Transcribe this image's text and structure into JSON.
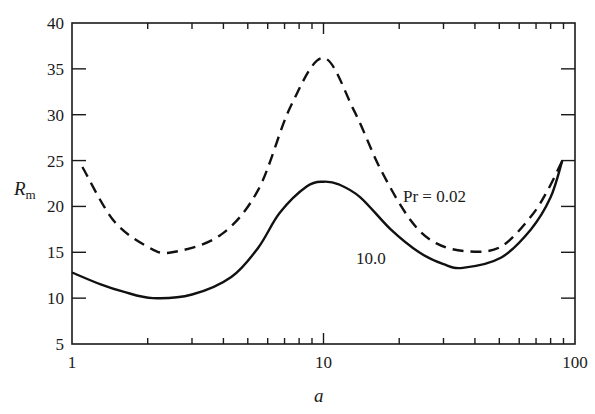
{
  "chart_data": {
    "type": "line",
    "title": "",
    "xlabel": "a",
    "ylabel": "R",
    "ylabel_subscript": "m",
    "xscale": "log",
    "xlim": [
      1,
      100
    ],
    "ylim": [
      5,
      40
    ],
    "x_ticks": [
      1,
      10,
      100
    ],
    "x_tick_labels": [
      "1",
      "10",
      "100"
    ],
    "y_ticks": [
      5,
      10,
      15,
      20,
      25,
      30,
      35,
      40
    ],
    "y_tick_labels": [
      "5",
      "10",
      "15",
      "20",
      "25",
      "30",
      "35",
      "40"
    ],
    "grid": false,
    "legend": "inline annotations",
    "series": [
      {
        "name": "Pr = 0.02",
        "style": "dashed",
        "annotation": "Pr = 0.02",
        "x": [
          1.1,
          1.46,
          2.0,
          2.5,
          3.9,
          5.5,
          7.4,
          10.0,
          13.2,
          16.9,
          22.2,
          28.0,
          37.5,
          50.7,
          66.8,
          78.0,
          89.0
        ],
        "y": [
          24.3,
          18.5,
          15.6,
          15.0,
          16.9,
          21.8,
          30.9,
          36.2,
          30.5,
          24.0,
          18.5,
          16.0,
          15.1,
          15.6,
          18.9,
          21.8,
          25.0
        ]
      },
      {
        "name": "Pr = 10.0",
        "style": "solid",
        "annotation": "10.0",
        "x": [
          1.0,
          1.3,
          1.6,
          2.1,
          3.0,
          4.3,
          5.5,
          6.7,
          8.6,
          10.0,
          11.5,
          14.0,
          18.5,
          24.0,
          30.0,
          35.8,
          50.7,
          66.8,
          80.0,
          89.0
        ],
        "y": [
          12.8,
          11.5,
          10.7,
          10.0,
          10.4,
          12.3,
          15.5,
          19.3,
          22.2,
          22.7,
          22.4,
          21.0,
          17.5,
          15.0,
          13.7,
          13.3,
          14.4,
          17.5,
          21.0,
          25.0
        ]
      }
    ]
  },
  "annotations": {
    "pr_low": "Pr = 0.02",
    "pr_high": "10.0"
  },
  "axes": {
    "x_title": "a",
    "y_title": "R",
    "y_title_sub": "m"
  }
}
